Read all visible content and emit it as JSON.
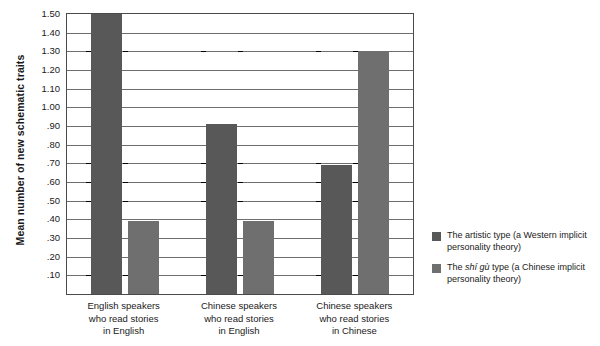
{
  "chart_data": {
    "type": "bar",
    "title": "",
    "xlabel": "",
    "ylabel": "Mean number of new schematic traits",
    "ylim": [
      0,
      1.5
    ],
    "ytick_values": [
      1.5,
      1.4,
      1.3,
      1.2,
      1.1,
      1.0,
      0.9,
      0.8,
      0.7,
      0.6,
      0.5,
      0.4,
      0.3,
      0.2,
      0.1
    ],
    "ytick_labels": [
      "1.50",
      "1.40",
      "1.30",
      "1.20",
      "1.10",
      "1.00",
      ".90",
      ".80",
      ".70",
      ".60",
      ".50",
      ".40",
      ".30",
      ".20",
      ".10"
    ],
    "grid": true,
    "legend_position": "right",
    "categories": [
      "English speakers who read stories in English",
      "Chinese speakers who read stories in English",
      "Chinese speakers who read stories in Chinese"
    ],
    "category_lines": [
      [
        "English speakers",
        "who read stories",
        "in English"
      ],
      [
        "Chinese speakers",
        "who read stories",
        "in English"
      ],
      [
        "Chinese speakers",
        "who read stories",
        "in Chinese"
      ]
    ],
    "series": [
      {
        "name": "The artistic type (a Western implicit personality theory)",
        "name_pre": "The artistic type (a Western implicit",
        "name_italic": "",
        "name_post": "personality theory)",
        "color": "#585858",
        "values": [
          1.5,
          0.91,
          0.69
        ]
      },
      {
        "name": "The shí gù type (a Chinese implicit personality theory)",
        "name_pre": "The ",
        "name_italic": "shí gù",
        "name_post": " type (a Chinese implicit personality theory)",
        "color": "#6f6f6f",
        "values": [
          0.39,
          0.39,
          1.3
        ]
      }
    ]
  },
  "legend": {
    "items": [
      {
        "line1_pre": "The artistic type (a Western implicit",
        "line2": "personality theory)"
      },
      {
        "line1_pre": "The ",
        "line1_italic": "shí gù",
        "line1_post": " type (a Chinese implicit",
        "line2": "personality theory)"
      }
    ]
  }
}
